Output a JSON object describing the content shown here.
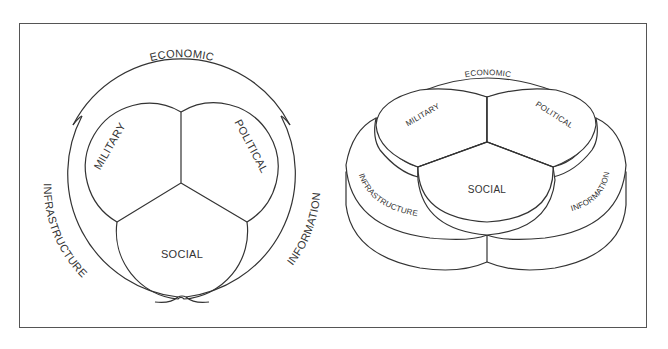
{
  "diagram": {
    "left_view": {
      "title": "flat-venn-diagram",
      "labels": {
        "economic": "ECONOMIC",
        "military": "MILITARY",
        "political": "POLITICAL",
        "social": "SOCIAL",
        "infrastructure": "INFRASTRUCTURE",
        "information": "INFORMATION"
      }
    },
    "right_view": {
      "title": "3d-venn-diagram",
      "labels": {
        "economic": "ECONOMIC",
        "military": "MILITARY",
        "political": "POLITICAL",
        "social": "SOCIAL",
        "infrastructure": "INFRASTRUCTURE",
        "information": "INFORMATION"
      }
    },
    "colors": {
      "stroke": "#333333",
      "frame": "#555555",
      "background": "#ffffff"
    }
  }
}
